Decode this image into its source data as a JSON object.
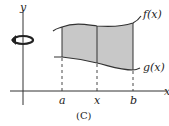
{
  "figure": {
    "caption": "(C)",
    "axes": {
      "y_label": "y",
      "x_label": "x"
    },
    "curves": [
      {
        "name": "f(x)",
        "label": "f(x)",
        "role": "upper"
      },
      {
        "name": "g(x)",
        "label": "g(x)",
        "role": "lower"
      }
    ],
    "ticks": [
      {
        "label": "a"
      },
      {
        "label": "x"
      },
      {
        "label": "b"
      }
    ],
    "rotation_axis": "y-axis",
    "shaded_region_color": "#c8c8c8",
    "line_color": "#333333"
  }
}
